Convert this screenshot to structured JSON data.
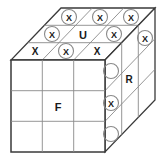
{
  "figure": {
    "type": "rubiks-cube-3x3-isometric-diagram",
    "background": "#ffffff",
    "outline_color": "#3a3a3a",
    "grid_color": "#8a8a8a",
    "mark_color": "#1a1a1a",
    "circle_color": "#8a8a8a"
  },
  "faces": {
    "front": {
      "label": "F",
      "label_cell": "center",
      "rows": 3,
      "cols": 3,
      "marks": [
        [
          "",
          "",
          ""
        ],
        [
          "",
          "F",
          ""
        ],
        [
          "",
          "",
          ""
        ]
      ]
    },
    "top": {
      "label": "U",
      "label_cell": "middle-center",
      "rows": 3,
      "cols": 3,
      "marks": [
        [
          "X-circled",
          "X-circled",
          "X-circled"
        ],
        [
          "X-circled",
          "U",
          "X-circled"
        ],
        [
          "X-plain",
          "X-circled",
          "X-plain"
        ]
      ]
    },
    "right": {
      "label": "R",
      "label_cell": "middle-center",
      "rows": 3,
      "cols": 3,
      "marks": [
        [
          "circle-empty",
          "",
          "X-circled"
        ],
        [
          "X-circled",
          "R",
          ""
        ],
        [
          "circle-empty",
          "",
          ""
        ]
      ]
    }
  },
  "marks": {
    "x_glyph": "X",
    "front_center_label": "F",
    "top_center_label": "U",
    "right_center_label": "R",
    "top_back_row": [
      "X",
      "X",
      "X"
    ],
    "top_middle_row": [
      "X",
      "U",
      "X"
    ],
    "top_front_row": [
      "X",
      "X",
      "X"
    ],
    "right_front_column": [
      "",
      "X",
      ""
    ]
  },
  "geometry": {
    "front_top_left": [
      11,
      60
    ],
    "front_top_right": [
      105,
      60
    ],
    "front_bottom_left": [
      11,
      152
    ],
    "front_bottom_right": [
      105,
      152
    ],
    "depth_dx": 50,
    "depth_dy": -52
  }
}
